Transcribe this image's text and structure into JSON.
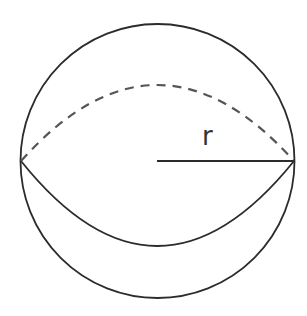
{
  "diagram": {
    "labels": {
      "radius": "r"
    },
    "colors": {
      "stroke": "#2b2b2b",
      "dashed": "#555555",
      "background": "#ffffff"
    }
  }
}
